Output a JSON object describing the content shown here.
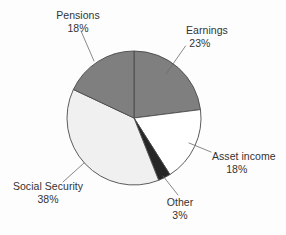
{
  "chart_data": {
    "type": "pie",
    "title": "",
    "subtitle": "",
    "xlabel": "",
    "ylabel": "",
    "legend_position": "none",
    "grid": false,
    "labels_outside": true,
    "start_angle_deg": 0,
    "direction": "clockwise",
    "categories": [
      "Earnings",
      "Asset income",
      "Other",
      "Social Security",
      "Pensions"
    ],
    "values": [
      23,
      18,
      3,
      38,
      18
    ],
    "unit": "%",
    "slices": [
      {
        "name": "Earnings",
        "label": "Earnings",
        "value": 23,
        "value_text": "23%",
        "color": "#7f7f7f",
        "start_deg": 0,
        "end_deg": 82.8
      },
      {
        "name": "Asset income",
        "label": "Asset income",
        "value": 18,
        "value_text": "18%",
        "color": "#ffffff",
        "start_deg": 82.8,
        "end_deg": 147.6
      },
      {
        "name": "Other",
        "label": "Other",
        "value": 3,
        "value_text": "3%",
        "color": "#262626",
        "start_deg": 147.6,
        "end_deg": 158.4
      },
      {
        "name": "Social Security",
        "label": "Social Security",
        "value": 38,
        "value_text": "38%",
        "color": "#f0f0f0",
        "start_deg": 158.4,
        "end_deg": 295.2
      },
      {
        "name": "Pensions",
        "label": "Pensions",
        "value": 18,
        "value_text": "18%",
        "color": "#7f7f7f",
        "start_deg": 295.2,
        "end_deg": 360
      }
    ]
  },
  "geometry": {
    "center_x": 134,
    "center_y": 118,
    "radius": 67
  },
  "colors": {
    "background": "#fdfdfd",
    "text": "#333333",
    "slice_outline": "#4a4a4a",
    "leader_line": "#6b6b6b",
    "gray_slice": "#7f7f7f",
    "light_slice": "#f0f0f0",
    "white_slice": "#ffffff",
    "dark_slice": "#262626"
  }
}
